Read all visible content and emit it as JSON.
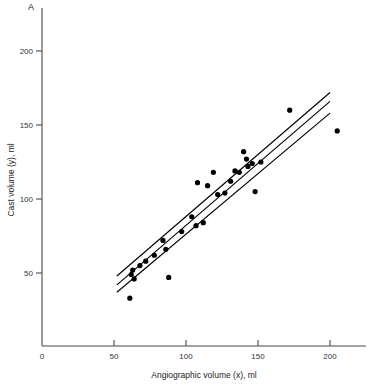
{
  "figure": {
    "panel_label": "A"
  },
  "chart_data": {
    "type": "scatter",
    "title": "",
    "panel": "A",
    "xlabel": "Angiographic volume (x), ml",
    "ylabel": "Cast volume (y), ml",
    "xlim": [
      0,
      225
    ],
    "ylim": [
      0,
      215
    ],
    "xticks": [
      0,
      50,
      100,
      150,
      200
    ],
    "yticks": [
      50,
      100,
      150,
      200
    ],
    "xtick_labels": [
      "0",
      "50",
      "100",
      "150",
      "200"
    ],
    "ytick_labels": [
      "50",
      "100",
      "150",
      "200"
    ],
    "grid": false,
    "legend": null,
    "points": [
      [
        61,
        33
      ],
      [
        62,
        49
      ],
      [
        63,
        52
      ],
      [
        64,
        46
      ],
      [
        68,
        55
      ],
      [
        72,
        58
      ],
      [
        78,
        62
      ],
      [
        84,
        72
      ],
      [
        86,
        66
      ],
      [
        88,
        47
      ],
      [
        97,
        78
      ],
      [
        104,
        88
      ],
      [
        107,
        82
      ],
      [
        108,
        111
      ],
      [
        112,
        84
      ],
      [
        115,
        109
      ],
      [
        119,
        118
      ],
      [
        122,
        103
      ],
      [
        127,
        104
      ],
      [
        131,
        112
      ],
      [
        134,
        119
      ],
      [
        137,
        118
      ],
      [
        140,
        132
      ],
      [
        142,
        127
      ],
      [
        143,
        122
      ],
      [
        146,
        124
      ],
      [
        148,
        105
      ],
      [
        152,
        125
      ],
      [
        172,
        160
      ],
      [
        205,
        146
      ]
    ],
    "fit_lines": [
      {
        "name": "regression-line",
        "x": [
          52,
          200
        ],
        "y": [
          42,
          166
        ]
      },
      {
        "name": "upper-confidence-band",
        "x": [
          52,
          200
        ],
        "y": [
          48,
          172
        ]
      },
      {
        "name": "lower-confidence-band",
        "x": [
          52,
          200
        ],
        "y": [
          37,
          158
        ]
      }
    ]
  }
}
